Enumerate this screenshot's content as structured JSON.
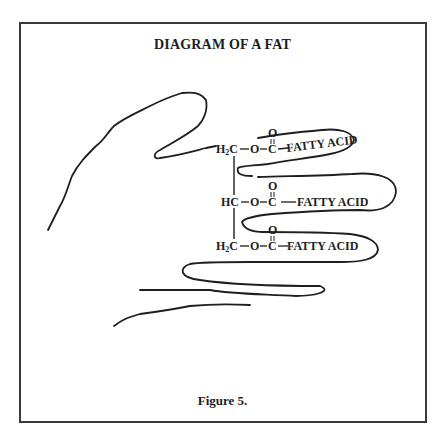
{
  "title": "DIAGRAM OF A FAT",
  "caption": "Figure 5.",
  "molecule": {
    "backbone": [
      {
        "label": "H",
        "sub": "2",
        "atom": "C",
        "row": 1
      },
      {
        "label": "H",
        "sub": "",
        "atom": "C",
        "row": 2
      },
      {
        "label": "H",
        "sub": "2",
        "atom": "C",
        "row": 3
      }
    ],
    "ester_oxygen": "O",
    "carbonyl_carbon": "C",
    "carbonyl_oxygen": "O",
    "chains": [
      {
        "label": "FATTY ACID"
      },
      {
        "label": "FATTY ACID"
      },
      {
        "label": "FATTY ACID"
      }
    ]
  },
  "illustration": {
    "subject": "hand outline with fingers enclosing three fatty acid chains",
    "stroke_color": "#1e1e1e",
    "border_color": "#3a3a3a"
  }
}
